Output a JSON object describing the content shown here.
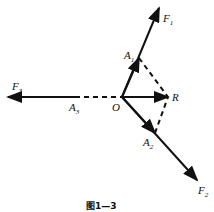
{
  "diagram": {
    "caption": "图1—3",
    "points": {
      "O": {
        "label": "O",
        "x": 122,
        "y": 97
      },
      "R": {
        "label": "R",
        "x": 168,
        "y": 97
      },
      "A1": {
        "label": "A",
        "sub": "1",
        "x": 139,
        "y": 58
      },
      "A2": {
        "label": "A",
        "sub": "2",
        "x": 155,
        "y": 133
      },
      "A3": {
        "label": "A",
        "sub": "3",
        "x": 75,
        "y": 97
      }
    },
    "forces": [
      {
        "label": "F",
        "sub": "1",
        "from": "O",
        "to": [
          159,
          8
        ]
      },
      {
        "label": "F",
        "sub": "2",
        "from": "O",
        "to": [
          197,
          180
        ]
      },
      {
        "label": "F",
        "sub": "3",
        "from": "O",
        "to": [
          8,
          97
        ]
      }
    ],
    "resultant": {
      "from": "O",
      "to": "R"
    },
    "dashed_lines": [
      [
        "A1",
        "R"
      ],
      [
        "A2",
        "R"
      ],
      [
        "A3",
        "O"
      ]
    ]
  }
}
